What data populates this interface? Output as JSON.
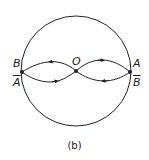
{
  "figure": {
    "caption": "(b)",
    "labels": {
      "B": "B",
      "A_bar": "A",
      "O": "O",
      "A": "A",
      "B_bar": "B"
    },
    "stroke_color": "#222222"
  }
}
